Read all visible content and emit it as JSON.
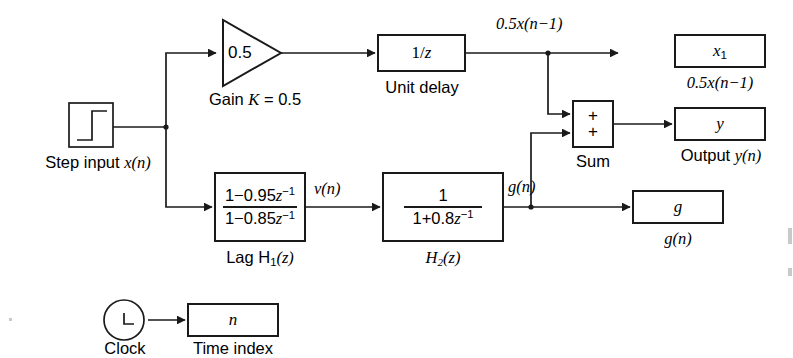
{
  "diagram": {
    "background_color": "#ffffff",
    "line_color": "#1a1a1a"
  },
  "sources": {
    "step": {
      "icon": "step-input-icon",
      "caption_prefix": "Step input ",
      "caption_var": "x(n)"
    },
    "clock": {
      "icon": "clock-icon",
      "caption": "Clock"
    }
  },
  "blocks": {
    "gain": {
      "value": "0.5",
      "caption_prefix": "Gain ",
      "caption_k": "K",
      "caption_suffix": " = 0.5"
    },
    "unit_delay": {
      "label_num": "1/",
      "label_var": "z",
      "caption": "Unit delay"
    },
    "lag_filter": {
      "numerator_a": "1−0.95",
      "numerator_var": "z",
      "numerator_exp": "−1",
      "denominator_a": "1−0.85",
      "denominator_var": "z",
      "denominator_exp": "−1",
      "caption_prefix": "Lag H",
      "caption_sub": "1",
      "caption_arg": "(z)"
    },
    "h2_filter": {
      "numerator": "1",
      "denominator_a": "1+0.8",
      "denominator_var": "z",
      "denominator_exp": "−1",
      "caption_prefix": "H",
      "caption_sub": "2",
      "caption_arg": "(z)"
    },
    "sum": {
      "sign_top": "+",
      "sign_bottom": "+",
      "caption": "Sum"
    }
  },
  "sinks": {
    "x1": {
      "label": "x",
      "label_sub": "1",
      "caption": "0.5x(n−1)"
    },
    "y": {
      "label": "y",
      "caption_prefix": "Output ",
      "caption_var": "y(n)"
    },
    "g": {
      "label": "g",
      "caption": "g(n)"
    },
    "time_index": {
      "label": "n",
      "caption": "Time index"
    }
  },
  "signal_labels": {
    "delay_out": "0.5x(n−1)",
    "lag_out": "v(n)",
    "h2_out": "g(n)"
  }
}
